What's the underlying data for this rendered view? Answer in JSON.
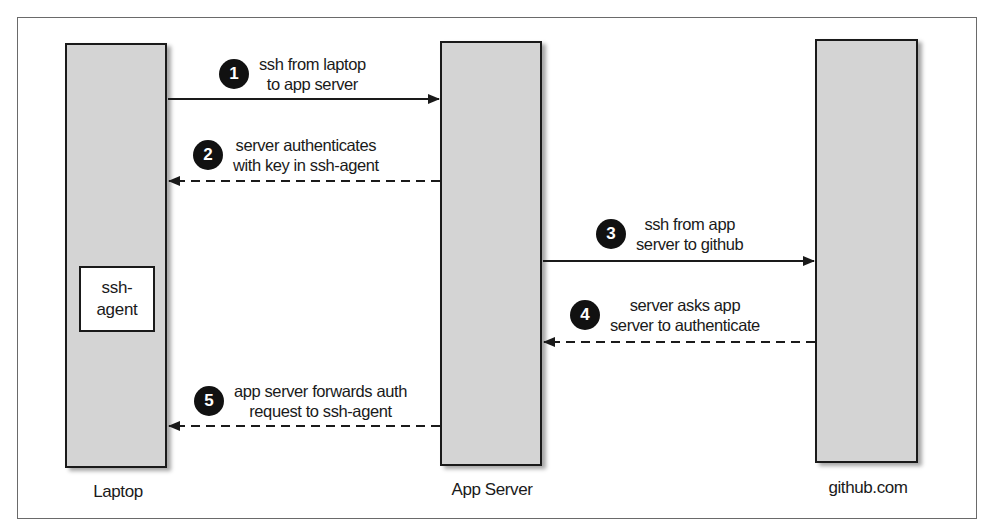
{
  "diagram": {
    "type": "sequence",
    "nodes": [
      {
        "id": "laptop",
        "label": "Laptop",
        "inner": {
          "line1": "ssh-",
          "line2": "agent"
        }
      },
      {
        "id": "app-server",
        "label": "App Server"
      },
      {
        "id": "github",
        "label": "github.com"
      }
    ],
    "steps": [
      {
        "number": "1",
        "line1": "ssh from laptop",
        "line2": "to app server",
        "from": "laptop",
        "to": "app-server",
        "style": "solid"
      },
      {
        "number": "2",
        "line1": "server authenticates",
        "line2": "with key in ssh-agent",
        "from": "app-server",
        "to": "laptop",
        "style": "dashed"
      },
      {
        "number": "3",
        "line1": "ssh from app",
        "line2": "server to github",
        "from": "app-server",
        "to": "github",
        "style": "solid"
      },
      {
        "number": "4",
        "line1": "server asks app",
        "line2": "server to authenticate",
        "from": "github",
        "to": "app-server",
        "style": "dashed"
      },
      {
        "number": "5",
        "line1": "app server forwards auth",
        "line2": "request to ssh-agent",
        "from": "app-server",
        "to": "laptop",
        "style": "dashed"
      }
    ],
    "colors": {
      "box_fill": "#d4d4d4",
      "stroke": "#1a1a1a",
      "badge": "#111111"
    }
  }
}
